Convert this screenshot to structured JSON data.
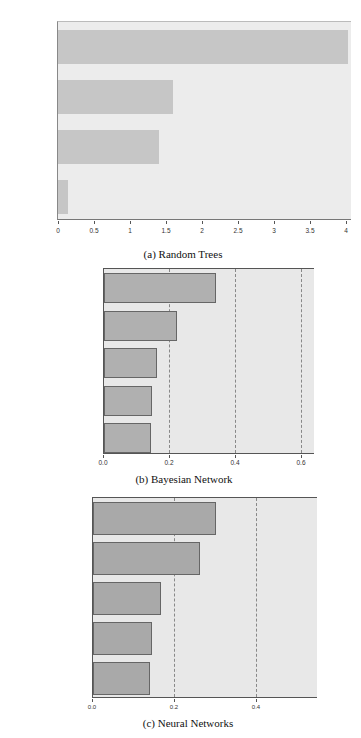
{
  "chart_data": [
    {
      "type": "bar",
      "orientation": "horizontal",
      "title": "(a)   Random Trees",
      "xlabel": "",
      "ylabel": "",
      "categories": [
        "age",
        "education",
        "Ethnic",
        "gender"
      ],
      "values": [
        4.04,
        1.6,
        1.4,
        0.14
      ],
      "xlim": [
        0,
        4.05
      ],
      "xticks": [
        "0",
        "0.5",
        "1",
        "1.5",
        "2",
        "2.5",
        "3",
        "3.5",
        "4"
      ],
      "grid": false,
      "bar_color": "#c6c6c6"
    },
    {
      "type": "bar",
      "orientation": "horizontal",
      "title": "(b)   Bayesian Network",
      "xlabel": "",
      "ylabel": "",
      "categories": [
        "education",
        "age",
        "Ethnic",
        "gender",
        "professional"
      ],
      "values": [
        0.34,
        0.22,
        0.16,
        0.145,
        0.142
      ],
      "xlim": [
        0,
        0.64
      ],
      "xticks": [
        "0.0",
        "0.2",
        "0.4",
        "0.6"
      ],
      "grid": "vertical dashed",
      "bar_color": "#b0b0b0"
    },
    {
      "type": "bar",
      "orientation": "horizontal",
      "title": "(c) Neural Networks",
      "xlabel": "",
      "ylabel": "",
      "categories": [
        "age",
        "Ethnic",
        "gender",
        "education",
        "professional"
      ],
      "values": [
        0.3,
        0.26,
        0.165,
        0.145,
        0.14
      ],
      "xlim": [
        0,
        0.55
      ],
      "xticks": [
        "0.0",
        "0.2",
        "0.4"
      ],
      "grid": "vertical dashed",
      "bar_color": "#a9a9a9"
    }
  ],
  "captions": {
    "a": "(a)   Random Trees",
    "b": "(b)   Bayesian Network",
    "c": "(c) Neural Networks"
  }
}
